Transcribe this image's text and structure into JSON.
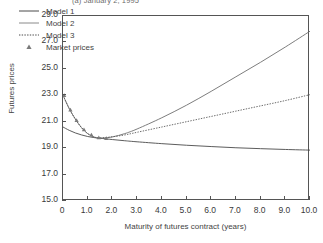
{
  "figure": {
    "title": "(a) January 2, 1995",
    "title_note": "clipped at top edge"
  },
  "chart_data": {
    "type": "line",
    "title": "(a) January 2, 1995",
    "xlabel": "Maturity of futures contract (years)",
    "ylabel": "Futures prices",
    "xlim": [
      0,
      10
    ],
    "ylim": [
      15.0,
      29.0
    ],
    "grid": false,
    "legend_position": "upper-left-inside",
    "xticks": [
      "0",
      "1.0",
      "2.0",
      "3.0",
      "4.0",
      "5.0",
      "6.0",
      "7.0",
      "8.0",
      "9.0",
      "10.0"
    ],
    "xtick_values": [
      0,
      1,
      2,
      3,
      4,
      5,
      6,
      7,
      8,
      9,
      10
    ],
    "yticks": [
      "15.0",
      "17.0",
      "19.0",
      "21.0",
      "23.0",
      "25.0",
      "27.0",
      "29.0"
    ],
    "ytick_values": [
      15.0,
      17.0,
      19.0,
      21.0,
      23.0,
      25.0,
      27.0,
      29.0
    ],
    "series": [
      {
        "name": "Model 1",
        "style": "solid",
        "color": "#4a4a4a",
        "x": [
          0,
          0.25,
          0.5,
          0.75,
          1.0,
          1.25,
          1.5,
          2.0,
          2.5,
          3.0,
          4.0,
          5.0,
          6.0,
          7.0,
          8.0,
          9.0,
          10.0
        ],
        "y": [
          20.6,
          20.35,
          20.15,
          20.0,
          19.88,
          19.8,
          19.75,
          19.65,
          19.56,
          19.48,
          19.34,
          19.22,
          19.12,
          19.03,
          18.96,
          18.9,
          18.85
        ]
      },
      {
        "name": "Model 2",
        "style": "solid",
        "color": "#6e6e6e",
        "x": [
          0,
          0.25,
          0.5,
          0.75,
          1.0,
          1.25,
          1.5,
          2.0,
          2.5,
          3.0,
          4.0,
          5.0,
          6.0,
          7.0,
          8.0,
          9.0,
          10.0
        ],
        "y": [
          23.0,
          22.0,
          21.2,
          20.55,
          20.1,
          19.85,
          19.75,
          19.85,
          20.1,
          20.45,
          21.3,
          22.25,
          23.3,
          24.4,
          25.5,
          26.65,
          27.85
        ]
      },
      {
        "name": "Model 3",
        "style": "dotted",
        "color": "#5a5a5a",
        "x": [
          0,
          0.25,
          0.5,
          0.75,
          1.0,
          1.25,
          1.5,
          2.0,
          2.5,
          3.0,
          4.0,
          5.0,
          6.0,
          7.0,
          8.0,
          9.0,
          10.0
        ],
        "y": [
          23.0,
          22.0,
          21.2,
          20.55,
          20.1,
          19.85,
          19.78,
          19.86,
          20.0,
          20.2,
          20.6,
          21.0,
          21.4,
          21.8,
          22.2,
          22.6,
          23.05
        ]
      },
      {
        "name": "Market prices",
        "style": "marker",
        "marker": "triangle",
        "color": "#7a7a7a",
        "x": [
          0.05,
          0.3,
          0.55,
          0.85,
          1.15,
          1.45,
          1.75
        ],
        "y": [
          23.0,
          21.9,
          21.1,
          20.4,
          20.0,
          19.8,
          19.75
        ]
      }
    ],
    "legend": [
      "Model 1",
      "Model 2",
      "Model 3",
      "Market prices"
    ]
  },
  "legend": {
    "items": [
      {
        "label": "Model 1",
        "key": "solid-line-icon"
      },
      {
        "label": "Model 2",
        "key": "solid-line-icon"
      },
      {
        "label": "Model 3",
        "key": "dotted-line-icon"
      },
      {
        "label": "Market prices",
        "key": "triangle-marker-icon"
      }
    ]
  },
  "colors": {
    "frame": "#555555",
    "text": "#3a3a3a",
    "background": "#ffffff"
  }
}
